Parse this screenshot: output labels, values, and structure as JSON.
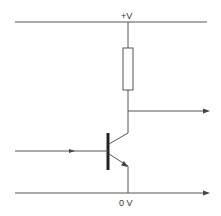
{
  "diagram": {
    "type": "circuit",
    "labels": {
      "supply": "+V",
      "ground": "0 V"
    },
    "components": [
      {
        "name": "resistor",
        "role": "collector load resistor"
      },
      {
        "name": "npn-transistor",
        "role": "switch"
      }
    ],
    "connections": [
      {
        "name": "supply-rail",
        "label": "+V"
      },
      {
        "name": "ground-rail",
        "label": "0 V",
        "direction": "output-right"
      },
      {
        "name": "input-line",
        "direction": "into-base"
      },
      {
        "name": "output-line",
        "direction": "output-right",
        "from": "collector"
      }
    ],
    "colors": {
      "wire": "#555555",
      "base_bar": "#222222",
      "background": "#ffffff"
    }
  }
}
